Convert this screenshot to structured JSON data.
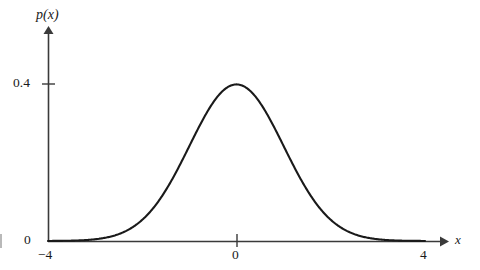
{
  "figure": {
    "background_color": "#ffffff",
    "curve_color": "#1a1a1a",
    "axis_color": "#3a3a3a"
  },
  "labels": {
    "y_axis": "p(x)",
    "x_axis": "x",
    "y_tick_peak": "0.4",
    "y_tick_zero": "0",
    "x_tick_min": "−4",
    "x_tick_mid": "0",
    "x_tick_max": "4"
  },
  "chart_data": {
    "type": "line",
    "title": "",
    "xlabel": "x",
    "ylabel": "p(x)",
    "xlim": [
      -4,
      4
    ],
    "ylim": [
      0,
      0.46
    ],
    "grid": false,
    "legend": null,
    "xticks": [
      -4,
      0,
      4
    ],
    "xticklabels": [
      "−4",
      "0",
      "4"
    ],
    "yticks": [
      0,
      0.4
    ],
    "yticklabels": [
      "0",
      "0.4"
    ],
    "annotations": [],
    "series": [
      {
        "name": "p(x)",
        "description": "standard normal probability density, mean 0, standard deviation 1, peak 0.3989 at x=0",
        "x": [
          -4.0,
          -3.8,
          -3.6,
          -3.4,
          -3.2,
          -3.0,
          -2.8,
          -2.6,
          -2.4,
          -2.2,
          -2.0,
          -1.8,
          -1.6,
          -1.4,
          -1.2,
          -1.0,
          -0.8,
          -0.6,
          -0.4,
          -0.2,
          0.0,
          0.2,
          0.4,
          0.6,
          0.8,
          1.0,
          1.2,
          1.4,
          1.6,
          1.8,
          2.0,
          2.2,
          2.4,
          2.6,
          2.8,
          3.0,
          3.2,
          3.4,
          3.6,
          3.8,
          4.0
        ],
        "y": [
          0.0001,
          0.0003,
          0.0006,
          0.0012,
          0.0024,
          0.0044,
          0.0079,
          0.0136,
          0.0224,
          0.0355,
          0.054,
          0.079,
          0.1109,
          0.1497,
          0.1942,
          0.242,
          0.2897,
          0.3332,
          0.3683,
          0.391,
          0.3989,
          0.391,
          0.3683,
          0.3332,
          0.2897,
          0.242,
          0.1942,
          0.1497,
          0.1109,
          0.079,
          0.054,
          0.0355,
          0.0224,
          0.0136,
          0.0079,
          0.0044,
          0.0024,
          0.0012,
          0.0006,
          0.0003,
          0.0001
        ]
      }
    ]
  }
}
